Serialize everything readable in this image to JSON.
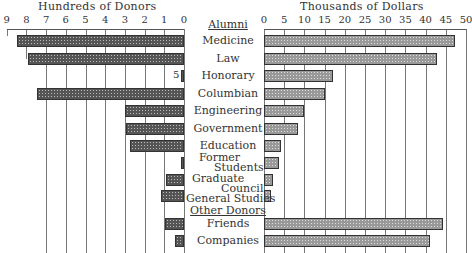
{
  "chart_data": [
    {
      "type": "bar",
      "orientation": "horizontal",
      "title": "Hundreds of Donors",
      "direction": "right-to-left",
      "xlim": [
        0,
        9
      ],
      "ticks": [
        "9",
        "8",
        "7",
        "6",
        "5",
        "4",
        "3",
        "2",
        "1",
        "0"
      ],
      "grid": true,
      "categories": [
        "Medicine",
        "Law",
        "Honorary",
        "Columbian",
        "Engineering",
        "Government",
        "Education",
        "Former Students",
        "Graduate Council",
        "General Studies",
        "Friends",
        "Companies"
      ],
      "values": [
        8.5,
        7.9,
        0.05,
        7.45,
        3.0,
        2.95,
        2.75,
        0.1,
        0.9,
        1.15,
        0.95,
        0.45
      ],
      "annotations": [
        {
          "category": "Honorary",
          "text": "5"
        }
      ]
    },
    {
      "type": "bar",
      "orientation": "horizontal",
      "title": "Thousands of Dollars",
      "xlim": [
        0,
        50
      ],
      "ticks": [
        "0",
        "5",
        "10",
        "15",
        "20",
        "25",
        "30",
        "35",
        "40",
        "45",
        "50"
      ],
      "grid": true,
      "categories": [
        "Medicine",
        "Law",
        "Honorary",
        "Columbian",
        "Engineering",
        "Government",
        "Education",
        "Former Students",
        "Graduate Council",
        "General Studies",
        "Friends",
        "Companies"
      ],
      "values": [
        47.3,
        42.8,
        17,
        15,
        10,
        8.4,
        4.3,
        3.7,
        2.2,
        1.7,
        44.3,
        41
      ]
    }
  ],
  "labels": {
    "left_title": "Hundreds of Donors",
    "right_title": "Thousands of Dollars",
    "group_alumni": "Alumni",
    "group_other": "Other Donors",
    "honorary_note": "5",
    "rows": [
      "Medicine",
      "Law",
      "Honorary",
      "Columbian",
      "Engineering",
      "Government",
      "Education",
      "Former",
      "Students",
      "Graduate",
      "Council",
      "General Studies",
      "Friends",
      "Companies"
    ]
  }
}
